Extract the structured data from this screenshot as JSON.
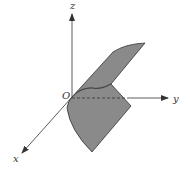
{
  "diagram": {
    "type": "3d-coordinate-surface",
    "axes": {
      "x_label": "x",
      "y_label": "y",
      "z_label": "z",
      "origin_label": "O"
    },
    "colors": {
      "surface_fill": "#8a8a8a",
      "surface_edge": "#333333",
      "axis": "#333333",
      "background": "#ffffff"
    }
  }
}
